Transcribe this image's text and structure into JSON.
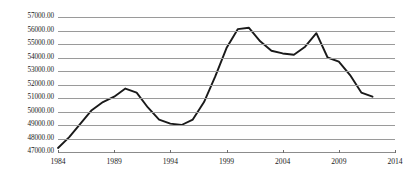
{
  "chart_data": {
    "type": "line",
    "title": "",
    "subtitle": "",
    "xlabel": "",
    "ylabel": "",
    "grid": true,
    "legend": false,
    "legend_position": "none",
    "line_color": "#1a1a1a",
    "grid_color": "#9a9a9a",
    "background_color": "#ffffff",
    "xlim": [
      1984,
      2014
    ],
    "ylim": [
      47000,
      57000
    ],
    "ytick_labels": [
      "57000.00",
      "56000.00",
      "55000.00",
      "54000.00",
      "53000.00",
      "52000.00",
      "51000.00",
      "50000.00",
      "49000.00",
      "48000.00",
      "47000.00"
    ],
    "ytick_values": [
      57000,
      56000,
      55000,
      54000,
      53000,
      52000,
      51000,
      50000,
      49000,
      48000,
      47000
    ],
    "xtick_labels": [
      "1984",
      "1989",
      "1994",
      "1999",
      "2004",
      "2009",
      "2014"
    ],
    "xtick_values": [
      1984,
      1989,
      1994,
      1999,
      2004,
      2009,
      2014
    ],
    "x": [
      1984,
      1985,
      1986,
      1987,
      1988,
      1989,
      1990,
      1991,
      1992,
      1993,
      1994,
      1995,
      1996,
      1997,
      1998,
      1999,
      2000,
      2001,
      2002,
      2003,
      2004,
      2005,
      2006,
      2007,
      2008,
      2009,
      2010,
      2011,
      2012
    ],
    "values": [
      47300,
      48100,
      49100,
      50100,
      50700,
      51100,
      51700,
      51400,
      50300,
      49400,
      49100,
      49000,
      49400,
      50700,
      52600,
      54700,
      56100,
      56200,
      55200,
      54500,
      54300,
      54200,
      54800,
      55800,
      54000,
      53700,
      52700,
      51400,
      51100
    ],
    "series": [
      {
        "name": "series-1",
        "values": [
          47300,
          48100,
          49100,
          50100,
          50700,
          51100,
          51700,
          51400,
          50300,
          49400,
          49100,
          49000,
          49400,
          50700,
          52600,
          54700,
          56100,
          56200,
          55200,
          54500,
          54300,
          54200,
          54800,
          55800,
          54000,
          53700,
          52700,
          51400,
          51100
        ]
      }
    ]
  }
}
